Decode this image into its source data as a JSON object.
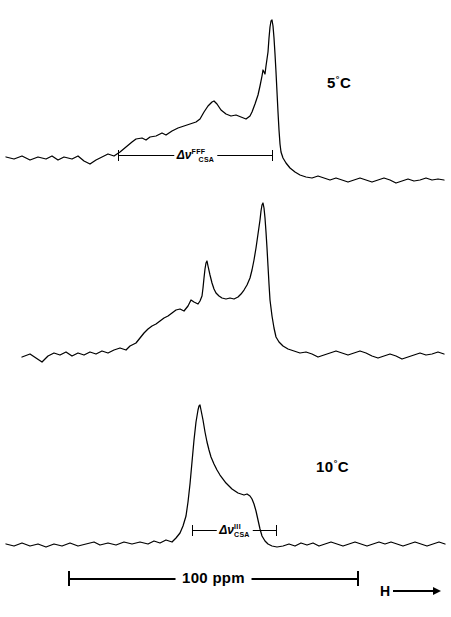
{
  "chart_data": {
    "type": "line",
    "title": "",
    "xlabel": "",
    "ylabel": "",
    "grid": false,
    "legend_position": "none",
    "scale_bar": {
      "label": "100 ppm",
      "value": 100,
      "units": "ppm",
      "x_start_px": 68,
      "x_end_px": 359
    },
    "field_direction": {
      "label": "H",
      "arrow": "right-arrow-icon"
    },
    "panels": [
      {
        "id": "panel-5c",
        "temperature_label": "5",
        "degree_symbol": "°",
        "unit": "C",
        "annotation": {
          "symbol": "Δν",
          "superscript": "FFF",
          "subscript": "CSA",
          "x_start_px": 118,
          "x_end_px": 273
        },
        "baseline_y": 158,
        "peaks": [
          {
            "name": "main-peak",
            "x_px": 272,
            "y_px": 20,
            "height_rel": 1.0
          },
          {
            "name": "shoulder-peak",
            "x_px": 214,
            "y_px": 105,
            "height_rel": 0.39
          }
        ],
        "path": "M6,157 L14,159 L22,156 L30,160 L38,157 L46,159 L52,156 L58,160 L64,157 L72,159 L78,156 L84,161 L90,164 L96,160 L102,157 L108,154 L114,156 L120,152 L126,147 L132,142 L136,139 L142,138 L146,140 L150,137 L156,136 L162,133 L166,135 L172,131 L178,128 L184,126 L190,124 L196,122 L200,119 L204,112 L208,106 L212,102 L214,101 L217,104 L221,110 L226,114 L231,116 L236,115 L241,117 L246,119 L250,116 L252,112 L255,104 L258,95 L260,86 L262,76 L263,70 L265,74 L266,66 L268,52 L269,38 L270,27 L271,21 L272,20 L273,26 L274,38 L275,54 L276,72 L277,92 L278,112 L279,130 L280,144 L281,152 L283,158 L286,163 L290,168 L295,172 L300,175 L306,177 L312,178 L318,176 L324,178 L330,180 L336,178 L342,180 L348,182 L354,180 L360,178 L366,180 L372,182 L378,180 L384,178 L390,180 L396,183 L402,181 L408,179 L414,181 L420,180 L426,178 L432,180 L438,179 L444,180"
      },
      {
        "id": "panel-10c",
        "temperature_label": "10",
        "degree_symbol": "°",
        "unit": "C",
        "annotation": null,
        "baseline_y": 358,
        "peaks": [
          {
            "name": "main-peak",
            "x_px": 263,
            "y_px": 13,
            "height_rel": 1.0
          },
          {
            "name": "secondary-peak",
            "x_px": 207,
            "y_px": 71,
            "height_rel": 0.62
          }
        ],
        "path": "M22,167 L30,164 L36,168 L42,172 L48,166 L54,163 L60,165 L66,162 L72,166 L78,163 L84,165 L90,162 L96,164 L102,161 L108,163 L114,160 L120,158 L126,160 L130,156 L136,153 L140,148 L144,143 L148,139 L152,136 L156,134 L160,131 L164,128 L168,126 L172,123 L176,120 L180,119 L184,121 L188,116 L191,110 L194,112 L198,114 L200,111 L202,106 L203,98 L204,88 L205,79 L206,73 L207,71 L208,76 L210,85 L212,93 L214,99 L216,103 L219,106 L222,108 L226,109 L230,108 L234,109 L238,107 L241,104 L244,100 L247,95 L250,88 L252,80 L254,70 L256,58 L258,44 L260,30 L261,21 L262,15 L263,13 L264,18 L265,28 L266,42 L267,58 L268,76 L269,94 L270,110 L272,126 L274,138 L276,147 L279,152 L283,156 L288,159 L294,161 L300,163 L306,162 L312,164 L318,167 L324,165 L330,163 L336,161 L342,163 L348,165 L354,163 L360,161 L366,163 L372,166 L378,168 L384,166 L390,164 L396,166 L402,169 L408,167 L414,165 L420,163 L426,165 L432,164 L438,162 L444,164"
      },
      {
        "id": "panel-20c",
        "temperature_label": "20",
        "degree_symbol": "°",
        "unit": "C",
        "annotation": {
          "symbol": "Δν",
          "superscript": "III",
          "subscript": "CSA",
          "x_start_px": 192,
          "x_end_px": 277
        },
        "baseline_y": 545,
        "peaks": [
          {
            "name": "main-peak",
            "x_px": 200,
            "y_px": 25,
            "height_rel": 1.0
          },
          {
            "name": "shoulder",
            "x_px": 245,
            "y_px": 115,
            "height_rel": 0.32
          }
        ],
        "path": "M6,164 L14,166 L22,163 L30,166 L38,164 L46,167 L54,164 L62,166 L70,163 L78,166 L86,164 L94,162 L100,165 L108,163 L116,165 L124,162 L132,164 L140,162 L148,164 L154,161 L160,163 L166,160 L172,162 L176,158 L180,153 L183,146 L186,136 L188,122 L190,104 L192,82 L194,60 L196,42 L198,30 L199,26 L200,25 L201,30 L203,40 L205,52 L207,62 L209,70 L211,77 L214,84 L217,90 L220,95 L223,99 L226,103 L229,106 L232,109 L235,111 L238,113 L241,114 L244,115 L247,114 L250,116 L252,119 L254,124 L256,131 L258,140 L260,149 L262,156 L265,161 L268,164 L272,166 L277,167 L283,166 L289,164 L295,166 L301,163 L307,165 L313,163 L319,166 L325,164 L331,162 L337,164 L343,166 L349,164 L355,162 L361,164 L367,166 L373,164 L379,162 L385,164 L391,162 L397,164 L403,166 L409,164 L415,162 L421,164 L427,166 L433,164 L439,162 L445,164"
      }
    ]
  }
}
